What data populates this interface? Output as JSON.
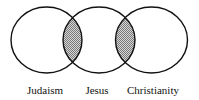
{
  "diagram": {
    "type": "venn",
    "sets": [
      {
        "label": "Judaism",
        "cx": 46.5,
        "cy": 40
      },
      {
        "label": "Jesus",
        "cx": 99,
        "cy": 40
      },
      {
        "label": "Christianity",
        "cx": 151.5,
        "cy": 40
      }
    ],
    "overlaps_shaded": [
      "Judaism ∩ Jesus",
      "Jesus ∩ Christianity"
    ],
    "colors": {
      "stroke": "#111111",
      "shade": "#b8b8b8",
      "background": "#ffffff"
    }
  }
}
